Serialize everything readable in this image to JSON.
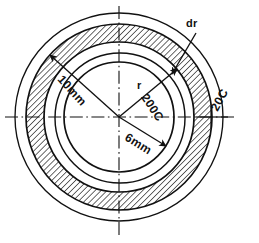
{
  "figure": {
    "type": "engineering-cross-section-diagram",
    "center": {
      "x": 119,
      "y": 117
    },
    "colors": {
      "line": "#111111",
      "hatch": "#111111",
      "background": "#ffffff"
    },
    "circles": [
      {
        "name": "outer-ambient-circle",
        "radius": 104,
        "stroke_width": 1.3
      },
      {
        "name": "hatch-outer-circle",
        "radius": 93,
        "stroke_width": 1.6
      },
      {
        "name": "hatch-inner-circle",
        "radius": 75,
        "stroke_width": 1.6
      },
      {
        "name": "mid-circle",
        "radius": 65,
        "stroke_width": 1.4
      },
      {
        "name": "inner-bore-circle",
        "radius": 55,
        "stroke_width": 1.6
      }
    ],
    "hatched_band": {
      "name": "hatched-annulus",
      "outer_radius": 93,
      "inner_radius": 75,
      "hatch_angle_deg": 45,
      "hatch_spacing": 4
    },
    "centerlines": {
      "style": "dash-dot",
      "horizontal": true,
      "vertical": true
    },
    "dimension_lines": [
      {
        "name": "dim-10mm",
        "label": "10mm",
        "from": "center",
        "angle_deg": 138,
        "length": 93,
        "arrow": "outer-end"
      },
      {
        "name": "dim-6mm",
        "label": "6mm",
        "from": "center",
        "angle_deg": -32,
        "length": 55,
        "arrow": "outer-end"
      },
      {
        "name": "dim-r",
        "label": "r",
        "from": "center",
        "angle_deg": 40,
        "length": 75,
        "arrow": "outer-end"
      },
      {
        "name": "leader-dr",
        "label": "dr",
        "angle_deg": 56,
        "arrow": "inner-end"
      },
      {
        "name": "leader-20c",
        "label": "20C",
        "angle_deg": 0,
        "arrow": "none"
      }
    ],
    "labels": {
      "dr": "dr",
      "r": "r",
      "inner_temperature": "200C",
      "outer_temperature": "20C",
      "outer_diameter": "10mm",
      "inner_diameter": "6mm"
    }
  }
}
